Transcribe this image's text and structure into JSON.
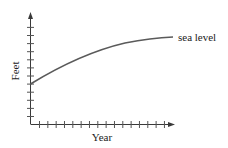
{
  "chart_data": {
    "type": "line",
    "title": "",
    "xlabel": "Year",
    "ylabel": "Feet",
    "grid": false,
    "legend": null,
    "x_ticks_count": 16,
    "y_ticks_count": 12,
    "x_tick_labels": [],
    "y_tick_labels": [],
    "series": [
      {
        "name": "sea level",
        "shape": "concave increasing curve, leveling off",
        "x": [
          0,
          3.5,
          7,
          10.5,
          14,
          16.5
        ],
        "y": [
          4,
          6.1,
          7.7,
          8.8,
          9.5,
          9.8
        ]
      }
    ],
    "annotations": [
      {
        "text": "sea level",
        "attached_to": "curve end"
      }
    ],
    "axis_ranges": {
      "x": [
        0,
        17
      ],
      "y": [
        0,
        13
      ]
    }
  },
  "labels": {
    "x_axis": "Year",
    "y_axis": "Feet",
    "curve": "sea level"
  },
  "colors": {
    "axis": "#3a3a3a",
    "curve": "#5a5a5a",
    "text": "#222222"
  }
}
